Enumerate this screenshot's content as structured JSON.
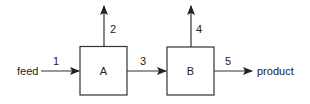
{
  "diagram": {
    "type": "process-flow",
    "units": [
      {
        "id": "A",
        "label": "A"
      },
      {
        "id": "B",
        "label": "B"
      }
    ],
    "streams": [
      {
        "number": "1",
        "from": "feed",
        "to": "A"
      },
      {
        "number": "2",
        "from": "A",
        "to": "out-top"
      },
      {
        "number": "3",
        "from": "A",
        "to": "B"
      },
      {
        "number": "4",
        "from": "B",
        "to": "out-top"
      },
      {
        "number": "5",
        "from": "B",
        "to": "product"
      }
    ],
    "inlet_label": "feed",
    "outlet_label": "product"
  }
}
